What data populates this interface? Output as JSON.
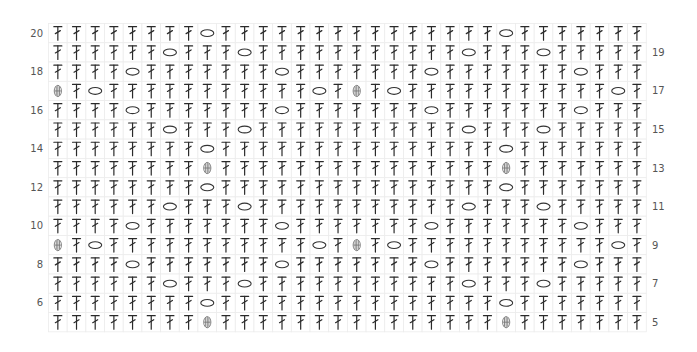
{
  "grid": {
    "columns": 32,
    "rows_top_to_bottom": [
      20,
      19,
      18,
      17,
      16,
      15,
      14,
      13,
      12,
      11,
      10,
      9,
      8,
      7,
      6,
      5
    ],
    "default_stitch": "dc"
  },
  "legend": {
    "dc": "double crochet (dc-icon)",
    "ch": "chain (chain-oval-icon)",
    "puff": "puff stitch (puff-icon)"
  },
  "labels": {
    "left": [
      "20",
      "18",
      "16",
      "14",
      "12",
      "10",
      "8",
      "6"
    ],
    "right": [
      "19",
      "17",
      "15",
      "13",
      "11",
      "9",
      "7",
      "5"
    ]
  },
  "rows": {
    "20": {
      "ch": [
        9,
        25
      ],
      "puff": []
    },
    "19": {
      "ch": [
        7,
        11,
        23,
        27
      ],
      "puff": []
    },
    "18": {
      "ch": [
        5,
        13,
        21,
        29
      ],
      "puff": []
    },
    "17": {
      "ch": [
        3,
        15,
        19,
        31
      ],
      "puff": [
        1,
        17
      ]
    },
    "16": {
      "ch": [
        5,
        13,
        21,
        29
      ],
      "puff": []
    },
    "15": {
      "ch": [
        7,
        11,
        23,
        27
      ],
      "puff": []
    },
    "14": {
      "ch": [
        9,
        25
      ],
      "puff": []
    },
    "13": {
      "ch": [],
      "puff": [
        9,
        25
      ]
    },
    "12": {
      "ch": [
        9,
        25
      ],
      "puff": []
    },
    "11": {
      "ch": [
        7,
        11,
        23,
        27
      ],
      "puff": []
    },
    "10": {
      "ch": [
        5,
        13,
        21,
        29
      ],
      "puff": []
    },
    "9": {
      "ch": [
        3,
        15,
        19,
        31
      ],
      "puff": [
        1,
        17
      ]
    },
    "8": {
      "ch": [
        5,
        13,
        21,
        29
      ],
      "puff": []
    },
    "7": {
      "ch": [
        7,
        11,
        23,
        27
      ],
      "puff": []
    },
    "6": {
      "ch": [
        9,
        25
      ],
      "puff": []
    },
    "5": {
      "ch": [],
      "puff": [
        9,
        25
      ]
    }
  }
}
